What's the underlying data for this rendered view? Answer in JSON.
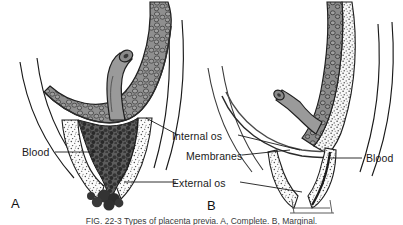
{
  "figure": {
    "panels": [
      {
        "letter": "A",
        "description": "Central placenta previa with hemorrhage filling cervical canal"
      },
      {
        "letter": "B",
        "description": "Marginal placenta with intact membranes over internal os"
      }
    ],
    "labels": {
      "internal_os": "Internal os",
      "membranes": "Membranes",
      "external_os": "External os",
      "blood_left": "Blood",
      "blood_right": "Blood"
    },
    "caption": "FIG. 22-3 Types of placenta previa. A, Complete. B, Marginal.",
    "colors": {
      "ink": "#1a1a1a",
      "placenta_fill": "#8d8d8d",
      "placenta_dark": "#4a4a4a",
      "clot": "#555555",
      "cervix_fill": "#f2f2f2",
      "stipple": "#4d4d4d",
      "cord_fill": "#9a9a9a",
      "background": "#ffffff"
    }
  }
}
